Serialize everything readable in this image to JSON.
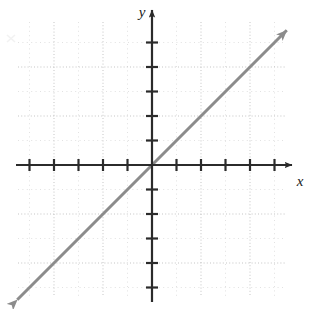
{
  "figure": {
    "name": "coordinate-plane-line-graph",
    "width": 312,
    "height": 309,
    "background_color": "#ffffff"
  },
  "axes": {
    "x_label": "x",
    "y_label": "y",
    "axis_color": "#2b2b2b",
    "origin_px": {
      "x": 152,
      "y": 165
    },
    "unit_px": 24.5,
    "x_ticks_negative": 5,
    "x_ticks_positive": 5,
    "y_ticks_negative": 5,
    "y_ticks_positive": 5,
    "x_tick_values": [
      -5,
      -4,
      -3,
      -2,
      -1,
      1,
      2,
      3,
      4,
      5
    ],
    "y_tick_values": [
      -5,
      -4,
      -3,
      -2,
      -1,
      1,
      2,
      3,
      4,
      5
    ],
    "tick_labels_shown": false,
    "x_arrow": "right",
    "y_arrow": "up"
  },
  "grid": {
    "visible": true,
    "style": "dotted",
    "color": "#c9c9c9",
    "major_color": "#bdbdbd",
    "major_spacing_units": 2,
    "minor_spacing_units": 1,
    "left_px": 18,
    "top_px": 22,
    "right_px": 286,
    "bottom_px": 297
  },
  "chart_data": {
    "type": "line",
    "title": "",
    "xlabel": "x",
    "ylabel": "y",
    "xlim": [
      -5.5,
      5.5
    ],
    "ylim": [
      -5.8,
      5.9
    ],
    "grid": true,
    "legend": "none",
    "series": [
      {
        "name": "y = x",
        "equation": "y = x",
        "slope": 1,
        "y_intercept": 0,
        "x_intercept": 0,
        "color": "#8c8c8c",
        "line_width": 3,
        "arrows": "both",
        "x": [
          -5.5,
          5.5
        ],
        "values": [
          -5.5,
          5.5
        ],
        "points": [
          {
            "x": -5,
            "y": -5
          },
          {
            "x": -3,
            "y": -3
          },
          {
            "x": 0,
            "y": 0
          },
          {
            "x": 3,
            "y": 3
          },
          {
            "x": 5,
            "y": 5
          }
        ]
      }
    ]
  }
}
